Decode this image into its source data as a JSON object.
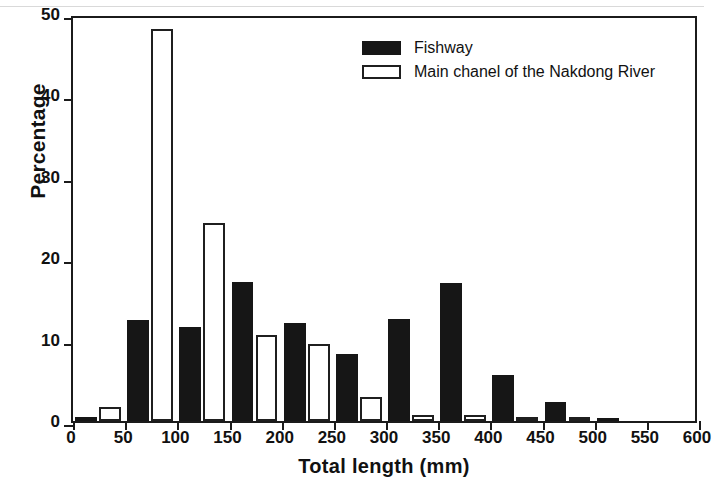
{
  "chart_data": {
    "type": "bar",
    "title": "",
    "subtitle": "",
    "xlabel": "Total length (mm)",
    "ylabel": "Percentage",
    "xlim": [
      0,
      600
    ],
    "ylim": [
      0,
      50
    ],
    "xticks": [
      0,
      50,
      100,
      150,
      200,
      250,
      300,
      350,
      400,
      450,
      500,
      550,
      600
    ],
    "yticks": [
      0,
      10,
      20,
      30,
      40,
      50
    ],
    "xtick_labels": [
      "0",
      "50",
      "100",
      "150",
      "200",
      "250",
      "300",
      "350",
      "400",
      "450",
      "500",
      "550",
      "600"
    ],
    "ytick_labels": [
      "0",
      "10",
      "20",
      "30",
      "40",
      "50"
    ],
    "grid": false,
    "legend_position": "top-center",
    "bin_width": 50,
    "categories": [
      "0-50",
      "50-100",
      "100-150",
      "150-200",
      "200-250",
      "250-300",
      "300-350",
      "350-400",
      "400-450",
      "450-500",
      "500-550",
      "550-600"
    ],
    "bin_starts": [
      0,
      50,
      100,
      150,
      200,
      250,
      300,
      350,
      400,
      450,
      500,
      550
    ],
    "series": [
      {
        "name": "Fishway",
        "color": "#161616",
        "fill": "solid-black",
        "values": [
          0.5,
          12.4,
          11.5,
          17.1,
          12.1,
          8.2,
          12.5,
          16.9,
          5.6,
          2.3,
          0.4,
          0
        ]
      },
      {
        "name": "Main chanel of the Nakdong River",
        "color": "#ffffff",
        "fill": "white-outlined",
        "values": [
          1.7,
          48.1,
          24.3,
          10.6,
          9.5,
          3.0,
          0.7,
          0.8,
          0.5,
          0.5,
          0,
          0
        ]
      }
    ]
  },
  "legend": {
    "items": [
      {
        "label": "Fishway",
        "swatch": "filled-black-swatch"
      },
      {
        "label": "Main chanel of the Nakdong River",
        "swatch": "open-white-swatch"
      }
    ]
  },
  "axes": {
    "x_title": "Total length (mm)",
    "y_title": "Percentage"
  }
}
